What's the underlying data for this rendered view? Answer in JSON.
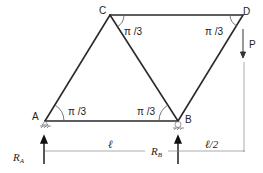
{
  "diagram": {
    "type": "truss",
    "nodes": [
      {
        "id": "A",
        "label": "A"
      },
      {
        "id": "B",
        "label": "B"
      },
      {
        "id": "C",
        "label": "C"
      },
      {
        "id": "D",
        "label": "D"
      }
    ],
    "members": [
      {
        "from": "A",
        "to": "B"
      },
      {
        "from": "A",
        "to": "C"
      },
      {
        "from": "C",
        "to": "B"
      },
      {
        "from": "C",
        "to": "D"
      },
      {
        "from": "B",
        "to": "D"
      }
    ],
    "angles": {
      "at_A": "π /3",
      "at_B": "π /3",
      "at_C": "π /3",
      "at_D": "π /3"
    },
    "load": {
      "label": "P",
      "node": "D",
      "direction": "down"
    },
    "reactions": {
      "RA": {
        "main": "R",
        "sub": "A"
      },
      "RB": {
        "main": "R",
        "sub": "B"
      }
    },
    "dimensions": {
      "AB": "ℓ",
      "B_to_D": "ℓ/2"
    },
    "colors": {
      "member": "#2a2a2a",
      "thin": "#888888"
    }
  }
}
